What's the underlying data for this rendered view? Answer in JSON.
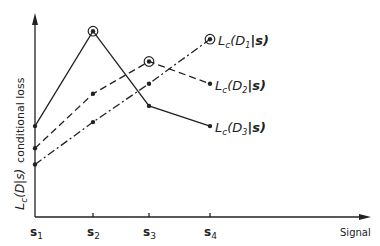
{
  "chart_data": {
    "type": "line",
    "title": "",
    "xlabel": "Signal",
    "ylabel": "L_c(D|s) conditional loss",
    "ylabel_parts": {
      "symbol": "L",
      "sub": "c",
      "arg": "(D|s)",
      "text": "conditional loss"
    },
    "categories": [
      "s1",
      "s2",
      "s3",
      "s4"
    ],
    "tick_labels": [
      {
        "main": "s",
        "sub": "1"
      },
      {
        "main": "s",
        "sub": "2"
      },
      {
        "main": "s",
        "sub": "3"
      },
      {
        "main": "s",
        "sub": "4"
      }
    ],
    "y_units": "relative (no numeric ticks)",
    "grid": false,
    "legend_position": "inline labels at right end of lines",
    "series": [
      {
        "name": "Lc(D1|s)",
        "label_main": "L",
        "label_sub": "c",
        "label_arg": "(D",
        "label_idx": "1",
        "label_end": "|s)",
        "style": "solid",
        "values": [
          4.5,
          9.2,
          5.5,
          4.5
        ],
        "max_marked_at": "s2"
      },
      {
        "name": "Lc(D2|s)",
        "label_main": "L",
        "label_sub": "c",
        "label_arg": "(D",
        "label_idx": "2",
        "label_end": "|s)",
        "style": "dashed",
        "values": [
          3.4,
          6.1,
          7.7,
          6.6
        ],
        "max_marked_at": "s3"
      },
      {
        "name": "Lc(D3|s)",
        "label_main": "L",
        "label_sub": "c",
        "label_arg": "(D",
        "label_idx": "3",
        "label_end": "|s)",
        "style": "dash-dot",
        "values": [
          2.6,
          4.7,
          6.6,
          8.8
        ],
        "max_marked_at": "s4"
      }
    ],
    "ylim": [
      0,
      10
    ]
  },
  "colors": {
    "ink": "#222222",
    "background": "#ffffff"
  }
}
